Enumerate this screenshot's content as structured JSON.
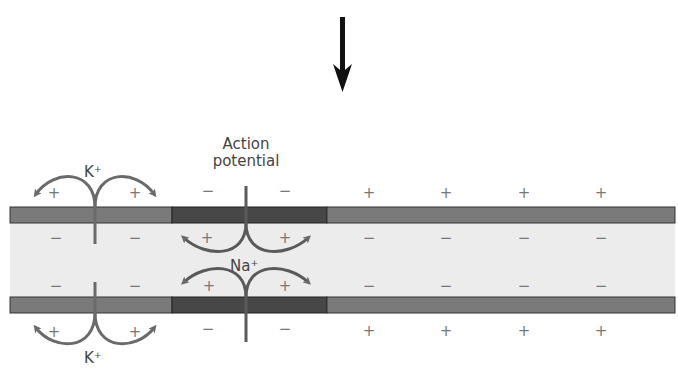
{
  "title_arrow": "direction-of-propagation-down-arrow",
  "labels": {
    "action_potential_line1": "Action",
    "action_potential_line2": "potential",
    "k_top": "K⁺",
    "k_bottom": "K⁺",
    "na": "Na⁺"
  },
  "colors": {
    "membrane_resting": "#7a7a7a",
    "membrane_active": "#4a4a4a",
    "cytoplasm": "#ebebeb",
    "arrow": "#6a6a6a",
    "sign": "#777777"
  },
  "signs": {
    "top_outside": [
      "+",
      "+",
      "−",
      "−",
      "+",
      "+",
      "+",
      "+"
    ],
    "top_inside": [
      "−",
      "−",
      "+",
      "+",
      "−",
      "−",
      "−",
      "−"
    ],
    "bottom_inside": [
      "−",
      "−",
      "+",
      "+",
      "−",
      "−",
      "−",
      "−"
    ],
    "bottom_outside": [
      "+",
      "+",
      "−",
      "−",
      "+",
      "+",
      "+",
      "+"
    ]
  }
}
